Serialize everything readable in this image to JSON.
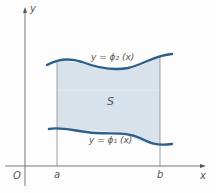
{
  "diagram": {
    "labels": {
      "y_axis": "y",
      "x_axis": "x",
      "origin": "O",
      "a": "a",
      "b": "b",
      "region": "S",
      "upper_curve": "y = ϕ₂ (x)",
      "lower_curve": "y = ϕ₁ (x)"
    },
    "colors": {
      "curve": "#2c5f8c",
      "fill": "#d8e2ea",
      "axis": "#777777",
      "bound_line": "#888888"
    }
  }
}
